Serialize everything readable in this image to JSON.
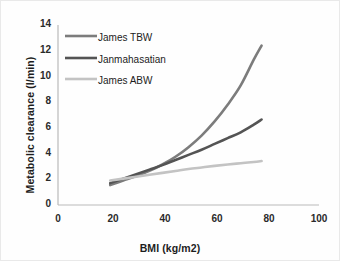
{
  "chart_data": {
    "type": "line",
    "title": "",
    "subtitle": "",
    "xlabel": "BMI (kg/m2)",
    "ylabel": "Metabolic clearance (l/min)",
    "xlim": [
      0,
      100
    ],
    "ylim": [
      0,
      14
    ],
    "xticks": [
      0,
      20,
      40,
      60,
      80,
      100
    ],
    "yticks": [
      0,
      2,
      4,
      6,
      8,
      10,
      12,
      14
    ],
    "grid": false,
    "legend_position": "upper-left-inside",
    "series": [
      {
        "name": "James TBW",
        "color": "#7c7c7c",
        "x": [
          20,
          25,
          30,
          35,
          40,
          45,
          50,
          55,
          60,
          65,
          70,
          75,
          78
        ],
        "values": [
          1.55,
          1.9,
          2.25,
          2.65,
          3.15,
          3.75,
          4.5,
          5.4,
          6.5,
          7.8,
          9.3,
          11.3,
          12.4
        ]
      },
      {
        "name": "Janmahasatian",
        "color": "#545454",
        "x": [
          20,
          25,
          30,
          35,
          40,
          45,
          50,
          55,
          60,
          65,
          70,
          75,
          78
        ],
        "values": [
          1.7,
          2.05,
          2.4,
          2.75,
          3.1,
          3.5,
          3.9,
          4.3,
          4.75,
          5.2,
          5.65,
          6.25,
          6.65
        ]
      },
      {
        "name": "James ABW",
        "color": "#c3c3c3",
        "x": [
          20,
          25,
          30,
          35,
          40,
          45,
          50,
          55,
          60,
          65,
          70,
          75,
          78
        ],
        "values": [
          1.9,
          2.05,
          2.2,
          2.35,
          2.5,
          2.65,
          2.8,
          2.92,
          3.04,
          3.15,
          3.25,
          3.35,
          3.42
        ]
      }
    ]
  },
  "axes": {
    "x_title": "BMI (kg/m2)",
    "y_title": "Metabolic clearance (l/min)",
    "x_tick_labels": [
      "0",
      "20",
      "40",
      "60",
      "80",
      "100"
    ],
    "y_tick_labels": [
      "0",
      "2",
      "4",
      "6",
      "8",
      "10",
      "12",
      "14"
    ]
  },
  "legend": {
    "items": [
      {
        "label": "James TBW",
        "color": "#7c7c7c"
      },
      {
        "label": "Janmahasatian",
        "color": "#545454"
      },
      {
        "label": "James ABW",
        "color": "#c3c3c3"
      }
    ]
  },
  "colors": {
    "background": "#fefefe",
    "axis_line": "#b9b9b9",
    "tick_text": "#2a2a2a",
    "series_tbw": "#7c7c7c",
    "series_jan": "#545454",
    "series_abw": "#c3c3c3"
  }
}
